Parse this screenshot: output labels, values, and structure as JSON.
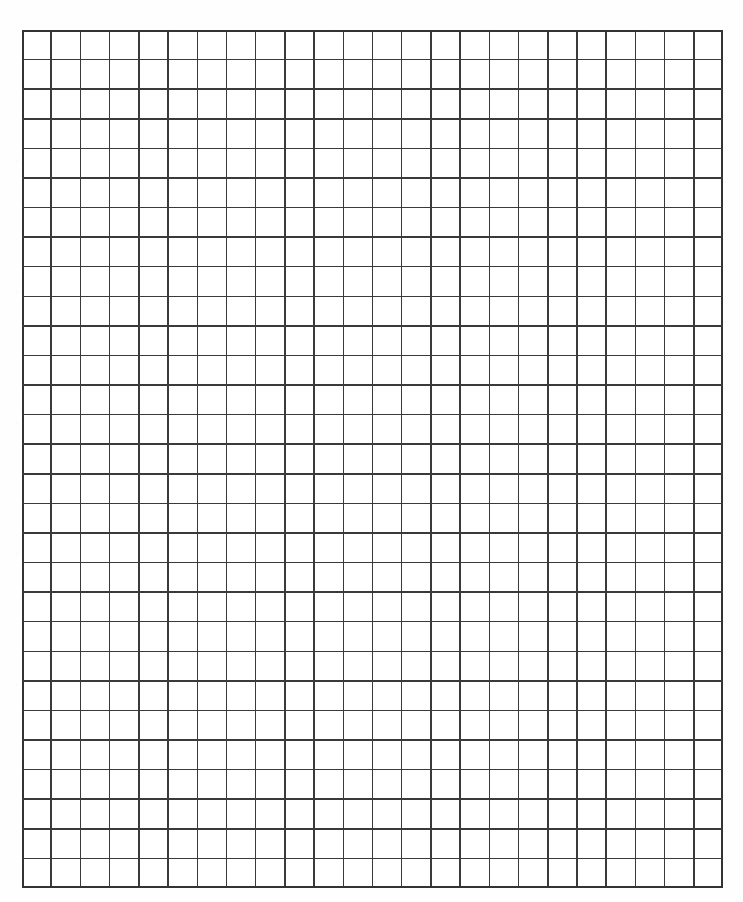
{
  "page": {
    "width": 743,
    "height": 902,
    "background_color": "#ffffff",
    "paper_color": "#fefefe"
  },
  "grid": {
    "name": "graph-paper-grid",
    "origin_x": 22,
    "origin_y": 30,
    "right_edge": 723,
    "bottom_edge": 888,
    "width": 701,
    "height": 858,
    "columns": 24,
    "rows": 29,
    "cell_width": 29.21,
    "cell_height": 29.59,
    "line_color": "#3a3a3a",
    "line_width": 1.5,
    "border_color": "#333333",
    "border_width": 1.8,
    "cell_fill": "#ffffff",
    "margins": {
      "left": 22,
      "top": 30,
      "right": 20,
      "bottom": 14
    }
  },
  "chart_data": {
    "type": "table",
    "title": "",
    "xlabel": "",
    "ylabel": "",
    "categories": [],
    "values": [],
    "grid": true,
    "legend": "none",
    "columns": 24,
    "rows": 29,
    "total_cells": 696
  }
}
